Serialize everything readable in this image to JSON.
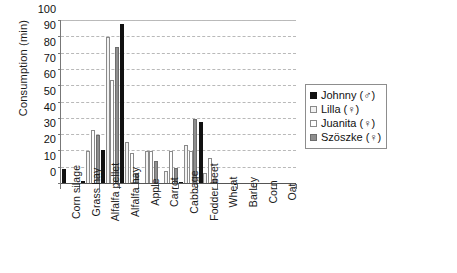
{
  "chart_data": {
    "type": "bar",
    "title": "",
    "xlabel": "",
    "ylabel": "Consumption (min)",
    "ylim": [
      0,
      100
    ],
    "yticks": [
      0,
      10,
      20,
      30,
      40,
      50,
      60,
      70,
      80,
      90,
      100
    ],
    "grid": true,
    "legend_position": "right",
    "categories": [
      "Corn silage",
      "Grass hay",
      "Alfalfa pellet",
      "Alfalfa hay",
      "Apple",
      "Carrot",
      "Cabbage",
      "Fodder beet",
      "Wheat",
      "Barley",
      "Corn",
      "Oat"
    ],
    "series": [
      {
        "name": "Johnny (♂)",
        "color": "#111111",
        "fill": "solid-black",
        "values": [
          9,
          2,
          21,
          98,
          0,
          0,
          1,
          38,
          0,
          0,
          0,
          0
        ]
      },
      {
        "name": "Lilla (♀)",
        "color": "#f2f2f2",
        "fill": "light-hatch",
        "values": [
          0,
          20,
          90,
          26,
          20,
          8,
          24,
          7,
          0,
          0,
          0,
          0
        ]
      },
      {
        "name": "Juanita (♀)",
        "color": "#ffffff",
        "fill": "white",
        "values": [
          0,
          33,
          64,
          19,
          20,
          20,
          20,
          16,
          0,
          0,
          0,
          0
        ]
      },
      {
        "name": "Szöszke (♀)",
        "color": "#8e8e8e",
        "fill": "gray",
        "values": [
          0,
          30,
          84,
          6,
          14,
          10,
          40,
          3,
          0,
          0,
          0,
          0
        ]
      }
    ]
  },
  "legend": {
    "items": [
      {
        "label": "Johnny (♂)"
      },
      {
        "label": "Lilla (♀)"
      },
      {
        "label": "Juanita (♀)"
      },
      {
        "label": "Szöszke (♀)"
      }
    ]
  }
}
